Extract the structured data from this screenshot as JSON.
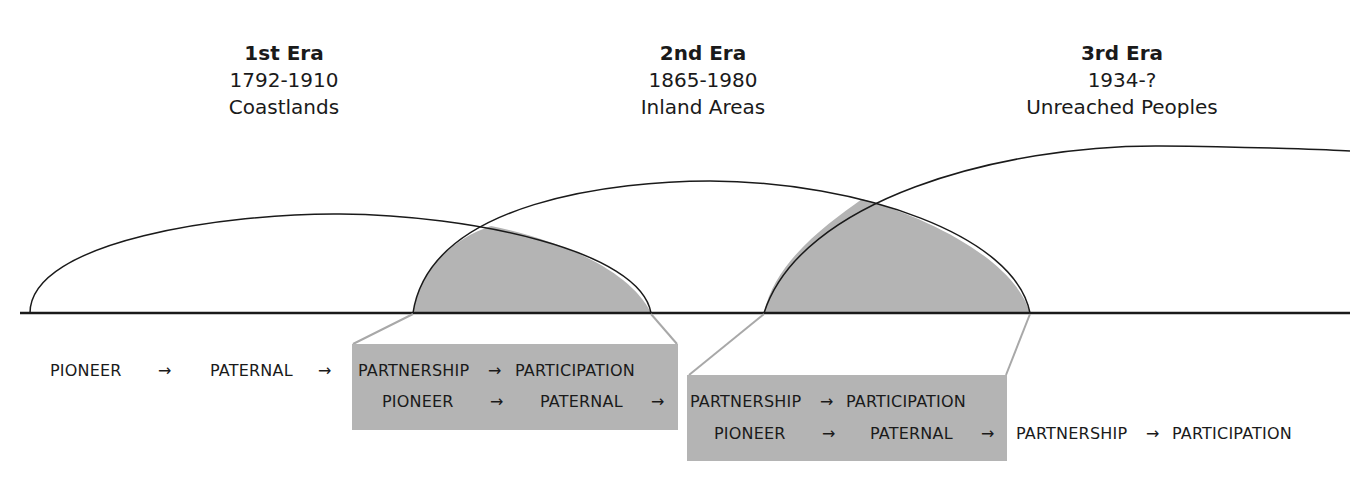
{
  "eras": [
    {
      "title": "1st Era",
      "dates": "1792-1910",
      "region": "Coastlands"
    },
    {
      "title": "2nd Era",
      "dates": "1865-1980",
      "region": "Inland Areas"
    },
    {
      "title": "3rd Era",
      "dates": "1934-?",
      "region": "Unreached Peoples"
    }
  ],
  "stages": {
    "pioneer": "PIONEER",
    "paternal": "PATERNAL",
    "partnership": "PARTNERSHIP",
    "participation": "PARTICIPATION",
    "arrow": "→"
  },
  "colors": {
    "curve": "#1a1a1a",
    "overlap_fill": "#b4b4b4",
    "connector": "#a8a8a8",
    "baseline": "#1a1a1a"
  }
}
